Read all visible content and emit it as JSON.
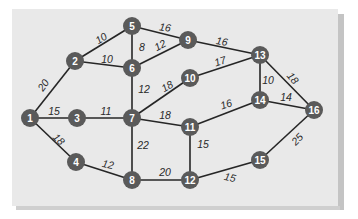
{
  "diagram": {
    "type": "weighted-undirected-graph",
    "colors": {
      "panel": "#e9e9e9",
      "node_fill": "#5a5a5a",
      "node_text": "#ffffff",
      "edge": "#262626",
      "label": "#2a2a2a"
    },
    "nodes": [
      {
        "id": "1",
        "label": "1",
        "x": 30,
        "y": 118
      },
      {
        "id": "2",
        "label": "2",
        "x": 75,
        "y": 61
      },
      {
        "id": "3",
        "label": "3",
        "x": 77,
        "y": 118
      },
      {
        "id": "4",
        "label": "4",
        "x": 76,
        "y": 162
      },
      {
        "id": "5",
        "label": "5",
        "x": 132,
        "y": 26
      },
      {
        "id": "6",
        "label": "6",
        "x": 132,
        "y": 68
      },
      {
        "id": "7",
        "label": "7",
        "x": 132,
        "y": 118
      },
      {
        "id": "8",
        "label": "8",
        "x": 132,
        "y": 180
      },
      {
        "id": "9",
        "label": "9",
        "x": 188,
        "y": 40
      },
      {
        "id": "10",
        "label": "10",
        "x": 190,
        "y": 78
      },
      {
        "id": "11",
        "label": "11",
        "x": 190,
        "y": 127
      },
      {
        "id": "12",
        "label": "12",
        "x": 190,
        "y": 180
      },
      {
        "id": "13",
        "label": "13",
        "x": 260,
        "y": 55
      },
      {
        "id": "14",
        "label": "14",
        "x": 260,
        "y": 100
      },
      {
        "id": "15",
        "label": "15",
        "x": 260,
        "y": 160
      },
      {
        "id": "16",
        "label": "16",
        "x": 314,
        "y": 110
      }
    ],
    "edges": [
      {
        "from": "1",
        "to": "2",
        "weight": "20",
        "lx": 43,
        "ly": 85,
        "rot": -55
      },
      {
        "from": "1",
        "to": "3",
        "weight": "15",
        "lx": 54,
        "ly": 111,
        "rot": 0
      },
      {
        "from": "1",
        "to": "4",
        "weight": "18",
        "lx": 59,
        "ly": 139,
        "rot": 45
      },
      {
        "from": "2",
        "to": "5",
        "weight": "10",
        "lx": 101,
        "ly": 38,
        "rot": -32
      },
      {
        "from": "2",
        "to": "6",
        "weight": "10",
        "lx": 107,
        "ly": 59,
        "rot": 0
      },
      {
        "from": "3",
        "to": "7",
        "weight": "11",
        "lx": 106,
        "ly": 111,
        "rot": 0
      },
      {
        "from": "4",
        "to": "8",
        "weight": "12",
        "lx": 108,
        "ly": 164,
        "rot": 12
      },
      {
        "from": "5",
        "to": "6",
        "weight": "8",
        "lx": 142,
        "ly": 47,
        "rot": 0
      },
      {
        "from": "5",
        "to": "9",
        "weight": "16",
        "lx": 165,
        "ly": 27,
        "rot": 8
      },
      {
        "from": "6",
        "to": "9",
        "weight": "12",
        "lx": 160,
        "ly": 45,
        "rot": -28
      },
      {
        "from": "6",
        "to": "7",
        "weight": "12",
        "lx": 144,
        "ly": 89,
        "rot": 0
      },
      {
        "from": "7",
        "to": "10",
        "weight": "18",
        "lx": 167,
        "ly": 86,
        "rot": -30
      },
      {
        "from": "7",
        "to": "11",
        "weight": "18",
        "lx": 165,
        "ly": 115,
        "rot": 0
      },
      {
        "from": "7",
        "to": "8",
        "weight": "22",
        "lx": 143,
        "ly": 145,
        "rot": 0
      },
      {
        "from": "8",
        "to": "12",
        "weight": "20",
        "lx": 165,
        "ly": 172,
        "rot": 0
      },
      {
        "from": "9",
        "to": "13",
        "weight": "16",
        "lx": 222,
        "ly": 41,
        "rot": 10
      },
      {
        "from": "10",
        "to": "13",
        "weight": "17",
        "lx": 220,
        "ly": 61,
        "rot": -18
      },
      {
        "from": "11",
        "to": "14",
        "weight": "16",
        "lx": 226,
        "ly": 104,
        "rot": -18
      },
      {
        "from": "11",
        "to": "12",
        "weight": "15",
        "lx": 203,
        "ly": 144,
        "rot": 0
      },
      {
        "from": "12",
        "to": "15",
        "weight": "15",
        "lx": 230,
        "ly": 177,
        "rot": 12
      },
      {
        "from": "13",
        "to": "14",
        "weight": "10",
        "lx": 268,
        "ly": 80,
        "rot": 0
      },
      {
        "from": "13",
        "to": "16",
        "weight": "18",
        "lx": 293,
        "ly": 78,
        "rot": 50
      },
      {
        "from": "14",
        "to": "16",
        "weight": "14",
        "lx": 286,
        "ly": 97,
        "rot": 0
      },
      {
        "from": "15",
        "to": "16",
        "weight": "25",
        "lx": 297,
        "ly": 139,
        "rot": -45
      }
    ]
  }
}
